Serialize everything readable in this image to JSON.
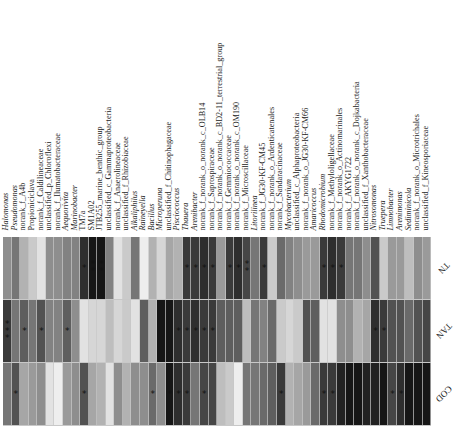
{
  "chart_data": {
    "type": "heatmap",
    "title": "",
    "xlabel": "",
    "ylabel": "",
    "value_meaning": "grayscale darkness 0 (white) to 1 (black)",
    "rows": [
      "TN",
      "TAN",
      "COD"
    ],
    "columns": [
      {
        "label": "Halomonas",
        "italic": true
      },
      {
        "label": "Pseudomonas",
        "italic": true
      },
      {
        "label": "norank_f_A4b",
        "italic": false
      },
      {
        "label": "Propioniciclava",
        "italic": false
      },
      {
        "label": "norank_f_Caldilineaceae",
        "italic": false
      },
      {
        "label": "unclassified_p_Chloroflexi",
        "italic": false
      },
      {
        "label": "norank_f_Ilumatobacteraceae",
        "italic": false
      },
      {
        "label": "Aequorivita",
        "italic": true
      },
      {
        "label": "Marinobacter",
        "italic": true
      },
      {
        "label": "TM7a",
        "italic": false
      },
      {
        "label": "SM1A02",
        "italic": false
      },
      {
        "label": "JTB255_marine_benthic_group",
        "italic": false
      },
      {
        "label": "unclassified_c_Gammaproteobacteria",
        "italic": false
      },
      {
        "label": "norank_f_Anaerolineaceae",
        "italic": false
      },
      {
        "label": "unclassified_f_Rhizobiaceae",
        "italic": false
      },
      {
        "label": "Alkaliphilus",
        "italic": true
      },
      {
        "label": "Raineyella",
        "italic": true
      },
      {
        "label": "Bacillus",
        "italic": true
      },
      {
        "label": "Microperuna",
        "italic": true
      },
      {
        "label": "unclassified_f_Chitinophagaceae",
        "italic": false
      },
      {
        "label": "Pisciococcus",
        "italic": true
      },
      {
        "label": "Thauera",
        "italic": true
      },
      {
        "label": "Arenibacter",
        "italic": true
      },
      {
        "label": "norank_f_norank_o_norank_c_OLB14",
        "italic": false
      },
      {
        "label": "norank_f_Saprospiraceae",
        "italic": false
      },
      {
        "label": "norank_f_norank_o_norank_c_BD2-11_terrestrial_group",
        "italic": false
      },
      {
        "label": "norank_f_Gemmiococcaceae",
        "italic": false
      },
      {
        "label": "norank_f_norank_o_norank_c_OM190",
        "italic": false
      },
      {
        "label": "norank_f_Microscillaceae",
        "italic": false
      },
      {
        "label": "Litorilinea",
        "italic": true
      },
      {
        "label": "norank_f_JG30-KF-CM45",
        "italic": false
      },
      {
        "label": "norank_f_norank_o_Ardenticatenales",
        "italic": false
      },
      {
        "label": "norank_f_Sandaracinaceae",
        "italic": false
      },
      {
        "label": "Mycobacterium",
        "italic": true
      },
      {
        "label": "unclassified_c_Alphaproteobacteria",
        "italic": false
      },
      {
        "label": "norank_f_norank_o_JG30-KF-CM66",
        "italic": false
      },
      {
        "label": "Amaricoccus",
        "italic": true
      },
      {
        "label": "Rhodomicrobium",
        "italic": true
      },
      {
        "label": "norank_f_Methyloligellaceae",
        "italic": false
      },
      {
        "label": "norank_f_norank_o_Actinomarinales",
        "italic": false
      },
      {
        "label": "norank_f_AKYG1722",
        "italic": false
      },
      {
        "label": "norank_f_norank_o_norank_c_Dojkabacteria",
        "italic": false
      },
      {
        "label": "unclassified_f_Xanthobacteraceae",
        "italic": false
      },
      {
        "label": "Nitrosomonas",
        "italic": true
      },
      {
        "label": "Truepera",
        "italic": true
      },
      {
        "label": "Limnobacter",
        "italic": true
      },
      {
        "label": "Arenimonas",
        "italic": true
      },
      {
        "label": "Sediminicola",
        "italic": true
      },
      {
        "label": "norank_f_norank_o_Microtrichales",
        "italic": false
      },
      {
        "label": "unclassified_f_Kineosporiaceae",
        "italic": false
      }
    ],
    "values": [
      [
        0.45,
        0.55,
        0.3,
        0.2,
        0.1,
        0.45,
        0.45,
        0.5,
        0.5,
        0.85,
        0.95,
        0.95,
        0.5,
        0.1,
        0.2,
        0.55,
        0.05,
        0.3,
        0.15,
        0.35,
        0.3,
        0.8,
        0.8,
        0.85,
        0.8,
        0.4,
        0.8,
        0.85,
        0.75,
        0.55,
        0.8,
        0.2,
        0.6,
        0.5,
        0.45,
        0.4,
        0.4,
        0.8,
        0.85,
        0.8,
        0.55,
        0.55,
        0.45,
        0.7,
        0.2,
        0.4,
        0.4,
        0.25,
        0.45,
        0.4
      ],
      [
        0.8,
        0.55,
        0.65,
        0.55,
        0.7,
        0.5,
        0.5,
        0.65,
        0.45,
        0.1,
        0.15,
        0.15,
        0.25,
        0.15,
        0.2,
        0.1,
        0.65,
        0.3,
        0.95,
        0.95,
        0.85,
        0.8,
        0.85,
        0.8,
        0.8,
        0.65,
        0.65,
        0.65,
        0.25,
        0.55,
        0.5,
        0.6,
        0.2,
        0.15,
        0.2,
        0.7,
        0.65,
        0.1,
        0.1,
        0.45,
        0.45,
        0.3,
        0.35,
        0.85,
        0.8,
        0.7,
        0.7,
        0.6,
        0.7,
        0.75
      ],
      [
        0.55,
        0.7,
        0.35,
        0.4,
        0.45,
        0.1,
        0.05,
        0.4,
        0.45,
        0.7,
        0.35,
        0.3,
        0.1,
        0.45,
        0.3,
        0.45,
        0.45,
        0.6,
        0.45,
        0.95,
        0.85,
        0.8,
        0.55,
        0.75,
        0.75,
        0.25,
        0.2,
        0.05,
        0.55,
        0.55,
        0.6,
        0.65,
        0.8,
        0.3,
        0.35,
        0.4,
        0.6,
        0.8,
        0.8,
        0.9,
        0.95,
        0.95,
        0.9,
        0.9,
        0.95,
        0.75,
        0.85,
        0.95,
        0.95,
        0.95
      ]
    ],
    "significance": [
      [
        "",
        "",
        "",
        "",
        "",
        "",
        "",
        "",
        "",
        "*",
        "**",
        "**",
        "",
        "",
        "",
        "",
        "",
        "",
        "",
        "",
        "",
        "*",
        "*",
        "*",
        "*",
        "",
        "*",
        "*",
        "**",
        "",
        "*",
        "",
        "",
        "",
        "",
        "",
        "",
        "*",
        "*",
        "*",
        "",
        "",
        "",
        "",
        "",
        "",
        "",
        "",
        "",
        ""
      ],
      [
        "***",
        "",
        "*",
        "",
        "*",
        "",
        "",
        "*",
        "",
        "",
        "",
        "",
        "",
        "",
        "",
        "",
        "",
        "",
        "",
        "",
        "*",
        "*",
        "*",
        "*",
        "*",
        "",
        "",
        "",
        "",
        "",
        "",
        "",
        "",
        "",
        "",
        "",
        "",
        "",
        "",
        "",
        "",
        "",
        "",
        "*",
        "*",
        "",
        "",
        "",
        "",
        ""
      ],
      [
        "",
        "*",
        "",
        "",
        "",
        "",
        "",
        "",
        "",
        "*",
        "",
        "",
        "",
        "",
        "",
        "",
        "",
        "*",
        "",
        "*",
        "*",
        "*",
        "",
        "*",
        "",
        "",
        "",
        "",
        "",
        "",
        "",
        "",
        "*",
        "",
        "",
        "",
        "",
        "*",
        "*",
        "",
        "",
        "",
        "",
        "",
        "",
        "*",
        "*",
        "",
        "",
        ""
      ]
    ]
  },
  "row_labels": {
    "r0": "TN",
    "r1": "TAN",
    "r2": "COD"
  }
}
